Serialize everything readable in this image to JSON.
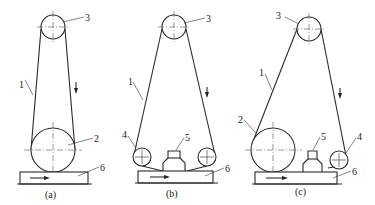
{
  "panels": [
    {
      "caption": "(a)",
      "labels": {
        "belt": "1",
        "contact_wheel": "2",
        "tension_wheel": "3",
        "workpiece": "6"
      },
      "description": "Contact-wheel belt grinding"
    },
    {
      "caption": "(b)",
      "labels": {
        "belt": "1",
        "guide_wheel": "4",
        "platen": "5",
        "tension_wheel": "3",
        "workpiece": "6"
      },
      "description": "Platen (pressure plate) belt grinding"
    },
    {
      "caption": "(c)",
      "labels": {
        "belt": "1",
        "contact_wheel": "2",
        "tension_wheel": "3",
        "guide_wheel": "4",
        "platen": "5",
        "workpiece": "6"
      },
      "description": "Combined contact wheel and platen belt grinding"
    }
  ],
  "legend": {
    "1": "abrasive belt",
    "2": "contact wheel",
    "3": "tension wheel",
    "4": "guide wheel",
    "5": "platen",
    "6": "workpiece"
  },
  "colors": {
    "line": "#2a2a2a",
    "background": "#ffffff"
  }
}
